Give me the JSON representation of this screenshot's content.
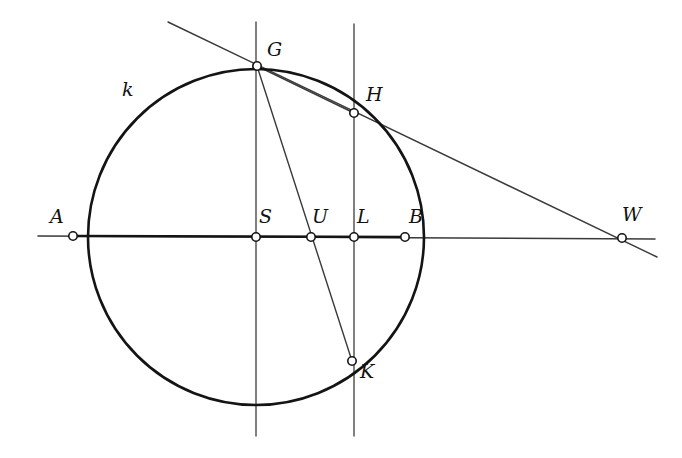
{
  "figure": {
    "width": 682,
    "height": 458,
    "background_color": "#ffffff",
    "stroke_color": "#1a1a1a",
    "thin_stroke_color": "#3a3a3a",
    "vertex_fill_color": "#ffffff"
  },
  "curves": [
    {
      "name": "circle-k",
      "label": "k",
      "label_x": 122,
      "label_y": 80,
      "center_x": 256,
      "center_y": 237,
      "radius": 168,
      "stroke_width": 2.6
    }
  ],
  "points": [
    {
      "id": "A",
      "label": "A",
      "x": 73,
      "y": 236,
      "label_x": 50,
      "label_y": 207
    },
    {
      "id": "S",
      "label": "S",
      "x": 256,
      "y": 237,
      "label_x": 259,
      "label_y": 207
    },
    {
      "id": "U",
      "label": "U",
      "x": 311,
      "y": 237,
      "label_x": 312,
      "label_y": 207
    },
    {
      "id": "L",
      "label": "L",
      "x": 354,
      "y": 237,
      "label_x": 357,
      "label_y": 207
    },
    {
      "id": "B",
      "label": "B",
      "x": 405,
      "y": 237,
      "label_x": 409,
      "label_y": 207
    },
    {
      "id": "W",
      "label": "W",
      "x": 622,
      "y": 238,
      "label_x": 622,
      "label_y": 205
    },
    {
      "id": "G",
      "label": "G",
      "x": 257,
      "y": 66,
      "label_x": 267,
      "label_y": 40
    },
    {
      "id": "H",
      "label": "H",
      "x": 354,
      "y": 113,
      "label_x": 366,
      "label_y": 85
    },
    {
      "id": "K",
      "label": "K",
      "x": 352,
      "y": 361,
      "label_x": 360,
      "label_y": 362
    }
  ],
  "lines": [
    {
      "name": "diameter-line-AB",
      "x1": 38,
      "y1": 236,
      "x2": 655,
      "y2": 239,
      "stroke_width": 1.6
    },
    {
      "name": "vertical-line-through-S",
      "x1": 256,
      "y1": 22,
      "x2": 256,
      "y2": 436,
      "stroke_width": 1.4
    },
    {
      "name": "vertical-line-through-L",
      "x1": 354,
      "y1": 24,
      "x2": 354,
      "y2": 436,
      "stroke_width": 1.4
    },
    {
      "name": "secant-line-GHW",
      "x1": 168,
      "y1": 22,
      "x2": 657,
      "y2": 257,
      "stroke_width": 1.4
    },
    {
      "name": "secant-line-GUK",
      "x1": 257,
      "y1": 66,
      "x2": 352,
      "y2": 361,
      "stroke_width": 1.4
    },
    {
      "name": "chord-GH",
      "x1": 257,
      "y1": 66,
      "x2": 354,
      "y2": 113,
      "stroke_width": 1.4
    }
  ],
  "segments_bold": [
    {
      "name": "chord-segment-AB",
      "x1": 73,
      "y1": 236,
      "x2": 405,
      "y2": 237,
      "stroke_width": 2.4
    }
  ]
}
